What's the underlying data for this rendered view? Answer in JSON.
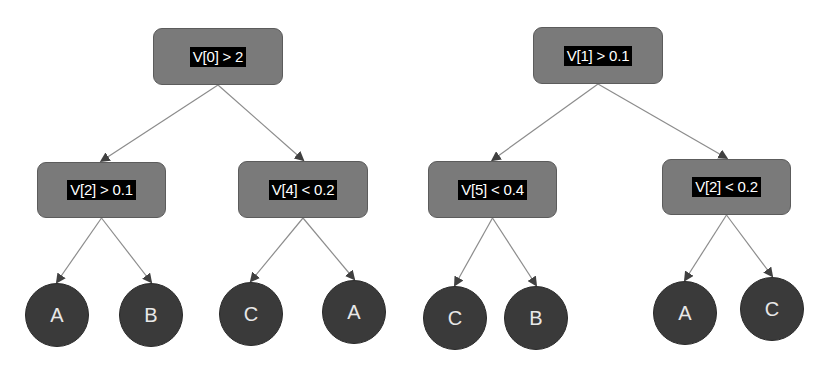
{
  "colors": {
    "decision_fill": "#7a7a7a",
    "decision_border": "#5c5c5c",
    "label_bg": "#000000",
    "label_text": "#ffffff",
    "leaf_fill": "#3a3a3a",
    "leaf_text": "#e8e8e8",
    "edge": "#8c8c8c",
    "background": "#ffffff"
  },
  "trees": [
    {
      "root": {
        "label": "V[0] > 2",
        "x": 153,
        "y": 28,
        "w": 130,
        "h": 57
      },
      "children": [
        {
          "label": "V[2] > 0.1",
          "x": 37,
          "y": 162,
          "w": 129,
          "h": 56,
          "leaves": [
            {
              "label": "A",
              "cx": 57,
              "cy": 315
            },
            {
              "label": "B",
              "cx": 151,
              "cy": 315
            }
          ]
        },
        {
          "label": "V[4] < 0.2",
          "x": 238,
          "y": 161,
          "w": 130,
          "h": 57,
          "leaves": [
            {
              "label": "C",
              "cx": 251,
              "cy": 314
            },
            {
              "label": "A",
              "cx": 354,
              "cy": 312
            }
          ]
        }
      ]
    },
    {
      "root": {
        "label": "V[1] > 0.1",
        "x": 533,
        "y": 27,
        "w": 130,
        "h": 57
      },
      "children": [
        {
          "label": "V[5] < 0.4",
          "x": 428,
          "y": 161,
          "w": 129,
          "h": 57,
          "leaves": [
            {
              "label": "C",
              "cx": 455,
              "cy": 318
            },
            {
              "label": "B",
              "cx": 536,
              "cy": 318
            }
          ]
        },
        {
          "label": "V[2] < 0.2",
          "x": 662,
          "y": 159,
          "w": 129,
          "h": 56,
          "leaves": [
            {
              "label": "A",
              "cx": 685,
              "cy": 313
            },
            {
              "label": "C",
              "cx": 772,
              "cy": 309
            }
          ]
        }
      ]
    }
  ]
}
